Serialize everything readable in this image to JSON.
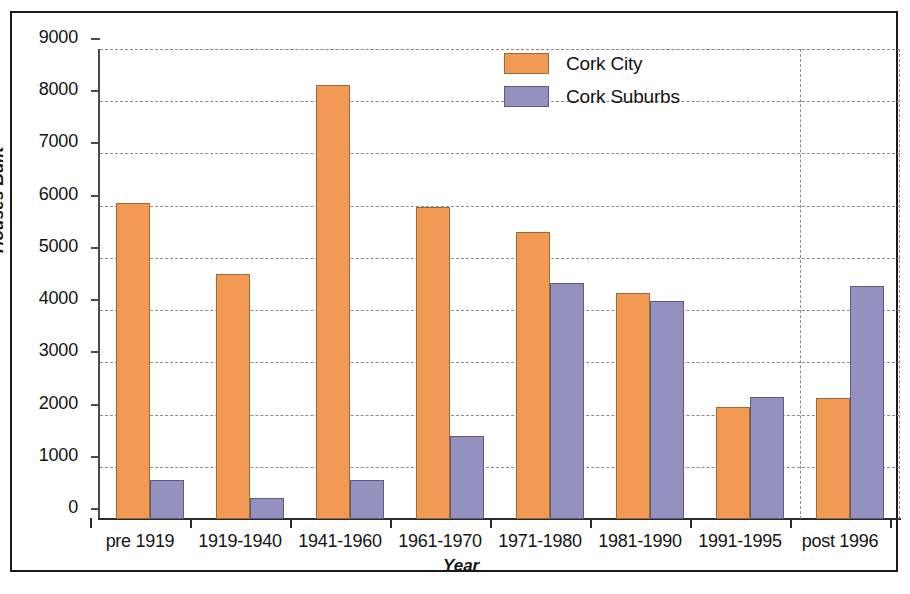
{
  "chart_data": {
    "type": "bar",
    "title": "",
    "xlabel": "Year",
    "ylabel": "Houses Built",
    "ylim": [
      0,
      9000
    ],
    "ytick_values": [
      0,
      1000,
      2000,
      3000,
      4000,
      5000,
      6000,
      7000,
      8000,
      9000
    ],
    "ytick_labels": [
      "0",
      "1000",
      "2000",
      "3000",
      "4000",
      "5000",
      "6000",
      "7000",
      "8000",
      "9000"
    ],
    "categories": [
      "pre 1919",
      "1919-1940",
      "1941-1960",
      "1961-1970",
      "1971-1980",
      "1981-1990",
      "1991-1995",
      "post 1996"
    ],
    "series": [
      {
        "name": "Cork City",
        "color": "#F29A54",
        "values": [
          6050,
          4690,
          8320,
          5970,
          5490,
          4330,
          2140,
          2320
        ]
      },
      {
        "name": "Cork Suburbs",
        "color": "#9391BE",
        "values": [
          750,
          400,
          740,
          1590,
          4520,
          4180,
          2340,
          4460
        ]
      }
    ],
    "grid": {
      "horizontal": true,
      "vertical_count": 1,
      "style": "dashed",
      "color": "#8a8a8a"
    },
    "legend": {
      "position": "top-right",
      "entries": [
        "Cork City",
        "Cork Suburbs"
      ]
    },
    "frame": {
      "outer_border_color": "#1a1a1a",
      "axis_color": "#2a2a2a"
    }
  }
}
